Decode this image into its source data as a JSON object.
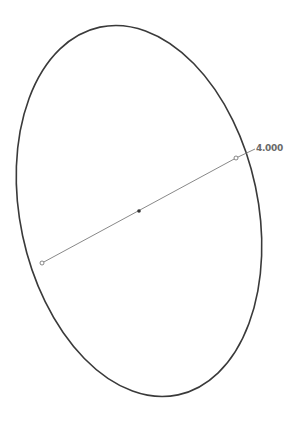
{
  "sketch": {
    "shape": "ellipse",
    "stroke_color": "#3a3a3a",
    "dimension_line_color": "#7a7a7a",
    "center_point_color": "#333333",
    "dimension": {
      "label": "4.000"
    }
  }
}
